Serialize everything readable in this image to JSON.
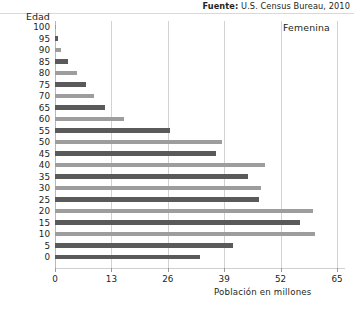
{
  "source": {
    "label": "Fuente:",
    "text": "U.S. Census Bureau, 2010"
  },
  "series_label": "Femenina",
  "chart_data": {
    "type": "bar",
    "orientation": "horizontal",
    "title": "",
    "xlabel": "Población en millones",
    "ylabel": "Edad",
    "xlim": [
      0,
      65
    ],
    "xticks": [
      0,
      13,
      26,
      39,
      52,
      65
    ],
    "xtick_labels": [
      "0",
      "13",
      "26",
      "39",
      "52",
      "65"
    ],
    "grid": true,
    "legend": "Femenina",
    "legend_position": "top-right",
    "categories": [
      "100",
      "95",
      "90",
      "85",
      "80",
      "75",
      "70",
      "65",
      "60",
      "55",
      "50",
      "45",
      "40",
      "35",
      "30",
      "25",
      "20",
      "15",
      "10",
      "5",
      "0"
    ],
    "values": [
      0.1,
      0.6,
      1.4,
      3.1,
      5.0,
      7.2,
      9.0,
      11.5,
      16.0,
      26.5,
      38.5,
      37.0,
      48.5,
      44.5,
      47.5,
      47.0,
      59.5,
      56.5,
      60.0,
      41.0,
      33.5
    ],
    "colors": {
      "light": "#9d9d9d",
      "dark": "#5a5a5a",
      "grid": "#d2d2d2",
      "axis": "#cfcfcf",
      "text": "#231f20"
    },
    "bar_shades": [
      "light",
      "dark",
      "light",
      "dark",
      "light",
      "dark",
      "light",
      "dark",
      "light",
      "dark",
      "light",
      "dark",
      "light",
      "dark",
      "light",
      "dark",
      "light",
      "dark",
      "light",
      "dark",
      "dark"
    ]
  }
}
